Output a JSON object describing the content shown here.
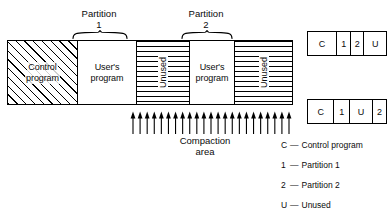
{
  "diagram": {
    "memory_bar": {
      "segments": [
        {
          "id": "control-program",
          "label": "Control\nprogram",
          "label_line1": "Control",
          "label_line2": "program",
          "fill": "diagonal-hatch",
          "orientation": "horizontal"
        },
        {
          "id": "user-program-1",
          "label_line1": "User's",
          "label_line2": "program",
          "fill": "none",
          "orientation": "horizontal"
        },
        {
          "id": "unused-1",
          "label": "Unused",
          "fill": "horizontal-hatch",
          "orientation": "vertical"
        },
        {
          "id": "user-program-2",
          "label_line1": "User's",
          "label_line2": "program",
          "fill": "none",
          "orientation": "horizontal"
        },
        {
          "id": "unused-2",
          "label": "Unused",
          "fill": "horizontal-hatch",
          "orientation": "vertical"
        }
      ]
    },
    "partitions": [
      {
        "id": "partition-1",
        "line1": "Partition",
        "line2": "1"
      },
      {
        "id": "partition-2",
        "line1": "Partition",
        "line2": "2"
      }
    ],
    "compaction": {
      "line1": "Compaction",
      "line2": "area",
      "arrow_count": 23,
      "arrow_direction": "up"
    },
    "maps": [
      {
        "id": "map-before",
        "cells": [
          "C",
          "1",
          "2",
          "U"
        ],
        "widths": [
          30,
          14,
          13,
          23
        ]
      },
      {
        "id": "map-after",
        "cells": [
          "C",
          "1",
          "U",
          "2"
        ],
        "widths": [
          27,
          16,
          23,
          14
        ]
      }
    ],
    "legend": {
      "dash": "—",
      "items": [
        {
          "key": "C",
          "text": "Control program"
        },
        {
          "key": "1",
          "text": "Partition 1"
        },
        {
          "key": "2",
          "text": "Partition 2"
        },
        {
          "key": "U",
          "text": "Unused"
        }
      ]
    },
    "colors": {
      "ink": "#0b0b0b",
      "line": "#000000",
      "background": "#ffffff"
    }
  }
}
